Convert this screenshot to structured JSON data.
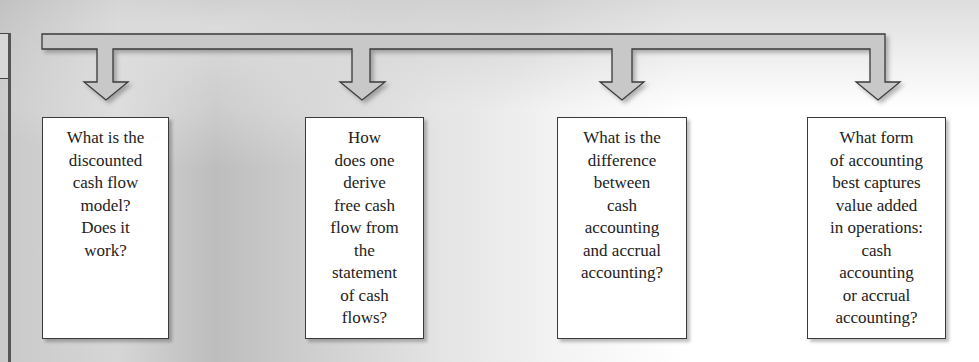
{
  "diagram": {
    "type": "flow-bracket",
    "connector": "one bracket line splitting into four downward arrows",
    "colors": {
      "arrow_fill": "#c8c8c8",
      "arrow_stroke": "#3a3a3a",
      "box_fill": "#ffffff",
      "box_border": "#3a3a3a",
      "text": "#222222"
    },
    "boxes": [
      {
        "id": "q1",
        "text": "What is the\ndiscounted\ncash flow\nmodel?\nDoes it\nwork?"
      },
      {
        "id": "q2",
        "text": "How\ndoes one\nderive\nfree cash\nflow from\nthe\nstatement\nof cash\nflows?"
      },
      {
        "id": "q3",
        "text": "What is the\ndifference\nbetween\ncash\naccounting\nand accrual\naccounting?"
      },
      {
        "id": "q4",
        "text": "What form\nof accounting\nbest captures\nvalue added\nin operations:\ncash\naccounting\nor accrual\naccounting?"
      }
    ]
  }
}
